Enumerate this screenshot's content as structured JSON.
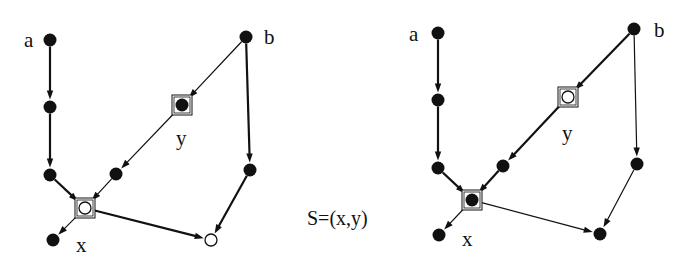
{
  "caption": "S=(x,y)",
  "colors": {
    "ink": "#111111",
    "background": "#ffffff",
    "hollow_fill": "#ffffff"
  },
  "graphs": [
    {
      "id": "left",
      "nodes": [
        {
          "id": "a",
          "x": 50,
          "y": 40,
          "filled": true,
          "label": "a",
          "lx": 24,
          "ly": 47,
          "boxed": false
        },
        {
          "id": "a2",
          "x": 50,
          "y": 107,
          "filled": true
        },
        {
          "id": "a3",
          "x": 50,
          "y": 175,
          "filled": true
        },
        {
          "id": "x",
          "x": 85,
          "y": 208,
          "filled": false,
          "boxed": true,
          "label": "x",
          "lx": 76,
          "ly": 252
        },
        {
          "id": "xc",
          "x": 53,
          "y": 240,
          "filled": true
        },
        {
          "id": "y",
          "x": 182,
          "y": 105,
          "filled": true,
          "boxed": true,
          "label": "y",
          "lx": 176,
          "ly": 145
        },
        {
          "id": "m",
          "x": 116,
          "y": 174,
          "filled": true
        },
        {
          "id": "b",
          "x": 246,
          "y": 37,
          "filled": true,
          "label": "b",
          "lx": 264,
          "ly": 44
        },
        {
          "id": "b2",
          "x": 250,
          "y": 170,
          "filled": true
        },
        {
          "id": "o",
          "x": 211,
          "y": 240,
          "filled": false
        }
      ],
      "edges": [
        {
          "from": "a",
          "to": "a2",
          "w": 2.2
        },
        {
          "from": "a2",
          "to": "a3",
          "w": 2.2
        },
        {
          "from": "a3",
          "to": "x",
          "w": 2.2
        },
        {
          "from": "b",
          "to": "y",
          "w": 1.2
        },
        {
          "from": "y",
          "to": "m",
          "w": 1.2
        },
        {
          "from": "m",
          "to": "x",
          "w": 1.2
        },
        {
          "from": "b",
          "to": "b2",
          "w": 2.2
        },
        {
          "from": "b2",
          "to": "o",
          "w": 2.2
        },
        {
          "from": "x",
          "to": "o",
          "w": 2.2
        },
        {
          "from": "x",
          "to": "xc",
          "w": 1.2
        }
      ]
    },
    {
      "id": "right",
      "nodes": [
        {
          "id": "a",
          "x": 438,
          "y": 33,
          "filled": true,
          "label": "a",
          "lx": 409,
          "ly": 41
        },
        {
          "id": "a2",
          "x": 438,
          "y": 100,
          "filled": true
        },
        {
          "id": "a3",
          "x": 438,
          "y": 168,
          "filled": true
        },
        {
          "id": "x",
          "x": 472,
          "y": 200,
          "filled": true,
          "boxed": true,
          "label": "x",
          "lx": 462,
          "ly": 246
        },
        {
          "id": "xc",
          "x": 439,
          "y": 235,
          "filled": true
        },
        {
          "id": "y",
          "x": 568,
          "y": 97,
          "filled": false,
          "boxed": true,
          "label": "y",
          "lx": 562,
          "ly": 140
        },
        {
          "id": "m",
          "x": 503,
          "y": 166,
          "filled": true
        },
        {
          "id": "b",
          "x": 634,
          "y": 29,
          "filled": true,
          "label": "b",
          "lx": 654,
          "ly": 37
        },
        {
          "id": "b2",
          "x": 637,
          "y": 164,
          "filled": true
        },
        {
          "id": "o",
          "x": 600,
          "y": 234,
          "filled": true
        }
      ],
      "edges": [
        {
          "from": "a",
          "to": "a2",
          "w": 2.2
        },
        {
          "from": "a2",
          "to": "a3",
          "w": 2.2
        },
        {
          "from": "a3",
          "to": "x",
          "w": 2.2
        },
        {
          "from": "b",
          "to": "y",
          "w": 2.2
        },
        {
          "from": "y",
          "to": "m",
          "w": 2.2
        },
        {
          "from": "m",
          "to": "x",
          "w": 2.2
        },
        {
          "from": "b",
          "to": "b2",
          "w": 1.2
        },
        {
          "from": "b2",
          "to": "o",
          "w": 1.2
        },
        {
          "from": "x",
          "to": "o",
          "w": 1.2
        },
        {
          "from": "x",
          "to": "xc",
          "w": 1.2
        }
      ]
    }
  ]
}
